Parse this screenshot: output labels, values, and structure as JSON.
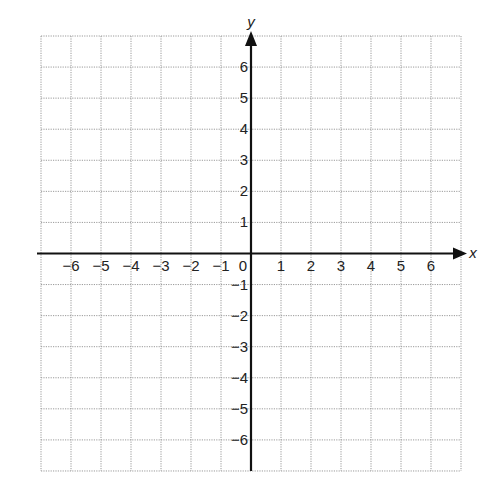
{
  "chart_data": {
    "type": "coordinate-grid",
    "title": "",
    "xlabel": "x",
    "ylabel": "y",
    "xlim": [
      -7,
      7
    ],
    "ylim": [
      -7,
      7
    ],
    "grid": true,
    "grid_style": "dotted",
    "x_tick_labels": [
      "-6",
      "-5",
      "-4",
      "-3",
      "-2",
      "-1",
      "0",
      "1",
      "2",
      "3",
      "4",
      "5",
      "6"
    ],
    "y_tick_labels": [
      "6",
      "5",
      "4",
      "3",
      "2",
      "1",
      "-1",
      "-2",
      "-3",
      "-4",
      "-5",
      "-6"
    ],
    "series": []
  },
  "axes": {
    "x_name": "x",
    "y_name": "y",
    "origin_label": "0"
  },
  "colors": {
    "grid": "#9a9a9a",
    "axis": "#111111",
    "text": "#222222"
  }
}
